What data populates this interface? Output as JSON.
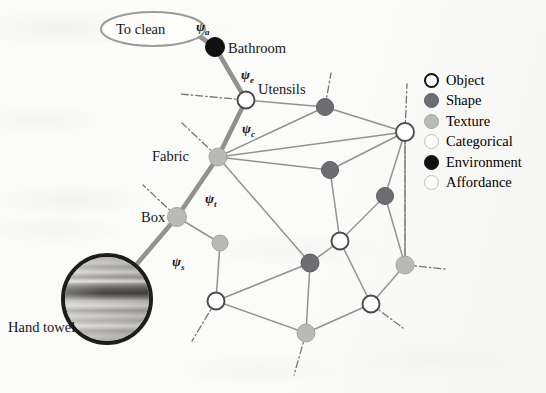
{
  "figure": {
    "type": "scene-graph-diagram",
    "background_color": "#fbfbf9"
  },
  "affordance_ellipse": {
    "label": "To clean",
    "cx": 153,
    "cy": 29,
    "rx": 52,
    "ry": 17,
    "stroke": "#9b9b98"
  },
  "photo": {
    "label": "Hand towel",
    "description": "circular crop of a striped hand towel"
  },
  "path_labels": [
    {
      "id": "psi_a",
      "base": "ψ",
      "sub": "a",
      "x": 196,
      "y": 20
    },
    {
      "id": "psi_e",
      "base": "ψ",
      "sub": "e",
      "x": 241,
      "y": 68
    },
    {
      "id": "psi_c",
      "base": "ψ",
      "sub": "c",
      "x": 242,
      "y": 122
    },
    {
      "id": "psi_t",
      "base": "ψ",
      "sub": "t",
      "x": 205,
      "y": 192
    },
    {
      "id": "psi_s",
      "base": "ψ",
      "sub": "s",
      "x": 172,
      "y": 255
    }
  ],
  "node_labels": [
    {
      "id": "bathroom",
      "text": "Bathroom",
      "x": 228,
      "y": 41
    },
    {
      "id": "utensils",
      "text": "Utensils",
      "x": 258,
      "y": 82
    },
    {
      "id": "fabric",
      "text": "Fabric",
      "x": 152,
      "y": 149
    },
    {
      "id": "box",
      "text": "Box",
      "x": 141,
      "y": 210
    },
    {
      "id": "handtowel",
      "text": "Hand towel",
      "x": 8,
      "y": 320
    }
  ],
  "legend": {
    "x": 424,
    "y": 70,
    "items": [
      {
        "label": "Object",
        "swatch": "sw-object",
        "marker": "thick-outline-circle",
        "color": "#ffffff"
      },
      {
        "label": "Shape",
        "swatch": "sw-shape",
        "marker": "filled-circle",
        "color": "#6e6e72"
      },
      {
        "label": "Texture",
        "swatch": "sw-texture",
        "marker": "filled-circle",
        "color": "#b9b9b6"
      },
      {
        "label": "Categorical",
        "swatch": "sw-categorical",
        "marker": "thin-outline-circle",
        "color": "#fdfdfc"
      },
      {
        "label": "Environment",
        "swatch": "sw-environment",
        "marker": "solid-black-circle",
        "color": "#101010"
      },
      {
        "label": "Affordance",
        "swatch": "sw-affordance",
        "marker": "thin-outline-circle",
        "color": "#fdfdfc"
      }
    ]
  },
  "graph": {
    "node_radius_default": 8.5,
    "nodes": [
      {
        "id": "n_bathroom",
        "x": 215,
        "y": 47,
        "r": 9.5,
        "type": "Environment"
      },
      {
        "id": "n_utensils",
        "x": 246,
        "y": 100,
        "r": 8.5,
        "type": "Object"
      },
      {
        "id": "n_fabric",
        "x": 218,
        "y": 157,
        "r": 9.0,
        "type": "Texture"
      },
      {
        "id": "n_box",
        "x": 177,
        "y": 217,
        "r": 9.5,
        "type": "Texture"
      },
      {
        "id": "n_towel",
        "x": 107,
        "y": 299,
        "r": 0,
        "type": "Photo"
      },
      {
        "id": "n_s1",
        "x": 325,
        "y": 107,
        "r": 8.5,
        "type": "Shape"
      },
      {
        "id": "n_o1",
        "x": 405,
        "y": 132,
        "r": 9.0,
        "type": "Object"
      },
      {
        "id": "n_s2",
        "x": 330,
        "y": 170,
        "r": 8.5,
        "type": "Shape"
      },
      {
        "id": "n_s3",
        "x": 385,
        "y": 196,
        "r": 8.5,
        "type": "Shape"
      },
      {
        "id": "n_o2",
        "x": 340,
        "y": 241,
        "r": 8.5,
        "type": "Object"
      },
      {
        "id": "n_t1",
        "x": 220,
        "y": 243,
        "r": 8.0,
        "type": "Texture"
      },
      {
        "id": "n_s4",
        "x": 310,
        "y": 263,
        "r": 9.0,
        "type": "Shape"
      },
      {
        "id": "n_t2",
        "x": 405,
        "y": 265,
        "r": 9.0,
        "type": "Texture"
      },
      {
        "id": "n_o3",
        "x": 216,
        "y": 301,
        "r": 8.5,
        "type": "Object"
      },
      {
        "id": "n_o4",
        "x": 371,
        "y": 304,
        "r": 8.5,
        "type": "Object"
      },
      {
        "id": "n_t3",
        "x": 306,
        "y": 333,
        "r": 9.0,
        "type": "Texture"
      }
    ],
    "thick_edges": [
      [
        "ellipse",
        "n_bathroom"
      ],
      [
        "n_bathroom",
        "n_utensils"
      ],
      [
        "n_utensils",
        "n_fabric"
      ],
      [
        "n_fabric",
        "n_box"
      ],
      [
        "n_box",
        "n_towel"
      ]
    ],
    "thin_edges": [
      [
        "n_utensils",
        "n_s1"
      ],
      [
        "n_utensils",
        "n_fabric"
      ],
      [
        "n_s1",
        "n_o1"
      ],
      [
        "n_fabric",
        "n_s1"
      ],
      [
        "n_fabric",
        "n_s2"
      ],
      [
        "n_fabric",
        "n_o1"
      ],
      [
        "n_s2",
        "n_o1"
      ],
      [
        "n_o1",
        "n_s3"
      ],
      [
        "n_o1",
        "n_t2"
      ],
      [
        "n_s2",
        "n_o2"
      ],
      [
        "n_s3",
        "n_o2"
      ],
      [
        "n_fabric",
        "n_s4"
      ],
      [
        "n_box",
        "n_t1"
      ],
      [
        "n_t1",
        "n_o3"
      ],
      [
        "n_o3",
        "n_s4"
      ],
      [
        "n_s4",
        "n_o2"
      ],
      [
        "n_s4",
        "n_t3"
      ],
      [
        "n_o3",
        "n_t3"
      ],
      [
        "n_t3",
        "n_o4"
      ],
      [
        "n_o4",
        "n_t2"
      ],
      [
        "n_s3",
        "n_t2"
      ],
      [
        "n_o2",
        "n_o4"
      ]
    ],
    "dashdot_stubs": [
      {
        "from": "n_utensils",
        "dx": -66,
        "dy": -6
      },
      {
        "from": "n_fabric",
        "dx": -36,
        "dy": -34
      },
      {
        "from": "n_box",
        "dx": -34,
        "dy": -32
      },
      {
        "from": "n_s1",
        "dx": 6,
        "dy": -34
      },
      {
        "from": "n_o1",
        "dx": 2,
        "dy": -48
      },
      {
        "from": "n_o1",
        "dx": 0,
        "dy": 135
      },
      {
        "from": "n_t2",
        "dx": 40,
        "dy": 4
      },
      {
        "from": "n_o3",
        "dx": -24,
        "dy": 40
      },
      {
        "from": "n_t3",
        "dx": -12,
        "dy": 42
      },
      {
        "from": "n_o4",
        "dx": 32,
        "dy": 24
      }
    ]
  },
  "colors": {
    "thick_edge": "#8d8d8a",
    "thin_edge": "#8a8a88",
    "dashdot": "#5e5e5c",
    "text": "#17161a",
    "environment": "#101010",
    "shape": "#6e6e72",
    "texture": "#b9b9b6",
    "object_fill": "#ffffff",
    "object_stroke": "#4a4a4a"
  }
}
